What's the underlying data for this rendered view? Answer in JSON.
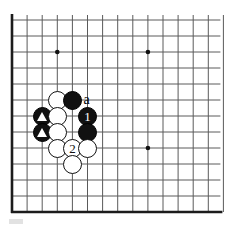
{
  "figure": {
    "kind": "go-board-diagram",
    "board": {
      "line_color": "#5a5a5a",
      "edge_color": "#1c1c1c",
      "background_color": "#ffffff",
      "origin_x": 12,
      "origin_y": 20,
      "cell_w": 15.1,
      "cell_h": 16.0,
      "cols": 14,
      "rows": 12,
      "edges_drawn": [
        "left",
        "bottom"
      ],
      "star_points": [
        {
          "col": 3,
          "row": 2
        },
        {
          "col": 9,
          "row": 2
        },
        {
          "col": 9,
          "row": 8
        }
      ]
    },
    "stones": [
      {
        "id": "w-a1",
        "color": "white",
        "col": 3,
        "row": 5,
        "marker": "none",
        "label": ""
      },
      {
        "id": "b-a1",
        "color": "black",
        "col": 4,
        "row": 5,
        "marker": "none",
        "label": ""
      },
      {
        "id": "b-tri1",
        "color": "black",
        "col": 2,
        "row": 6,
        "marker": "triangle",
        "label": ""
      },
      {
        "id": "w-b1",
        "color": "white",
        "col": 3,
        "row": 6,
        "marker": "none",
        "label": ""
      },
      {
        "id": "b-move1",
        "color": "black",
        "col": 5,
        "row": 6,
        "marker": "none",
        "label": "1"
      },
      {
        "id": "b-tri2",
        "color": "black",
        "col": 2,
        "row": 7,
        "marker": "triangle",
        "label": ""
      },
      {
        "id": "w-b2",
        "color": "white",
        "col": 3,
        "row": 7,
        "marker": "none",
        "label": ""
      },
      {
        "id": "b-c1",
        "color": "black",
        "col": 5,
        "row": 7,
        "marker": "none",
        "label": ""
      },
      {
        "id": "w-c1",
        "color": "white",
        "col": 3,
        "row": 8,
        "marker": "none",
        "label": ""
      },
      {
        "id": "w-move2",
        "color": "white",
        "col": 4,
        "row": 8,
        "marker": "none",
        "label": "2"
      },
      {
        "id": "w-c2",
        "color": "white",
        "col": 5,
        "row": 8,
        "marker": "none",
        "label": ""
      },
      {
        "id": "w-d1",
        "color": "white",
        "col": 4,
        "row": 9,
        "marker": "none",
        "label": ""
      }
    ],
    "point_labels": [
      {
        "id": "label-a",
        "text": "a",
        "col": 5,
        "row": 5
      }
    ],
    "footer_artifact": {
      "present": true,
      "color": "#e2e2e2"
    }
  },
  "chart_data": {
    "type": "table",
    "xlabel": "column (grid index from left edge)",
    "ylabel": "row (grid index from top line)",
    "legend": [
      "black stone",
      "white stone",
      "triangle-marked black stone",
      "numbered move",
      "point label"
    ],
    "grid": true,
    "xlim": [
      0,
      14
    ],
    "ylim": [
      0,
      12
    ],
    "columns": [
      "col",
      "row",
      "color",
      "marker",
      "label"
    ],
    "rows": [
      [
        3,
        5,
        "white",
        "none",
        ""
      ],
      [
        4,
        5,
        "black",
        "none",
        ""
      ],
      [
        5,
        5,
        "none",
        "none",
        "a"
      ],
      [
        2,
        6,
        "black",
        "triangle",
        ""
      ],
      [
        3,
        6,
        "white",
        "none",
        ""
      ],
      [
        5,
        6,
        "black",
        "none",
        "1"
      ],
      [
        2,
        7,
        "black",
        "triangle",
        ""
      ],
      [
        3,
        7,
        "white",
        "none",
        ""
      ],
      [
        5,
        7,
        "black",
        "none",
        ""
      ],
      [
        3,
        8,
        "white",
        "none",
        ""
      ],
      [
        4,
        8,
        "white",
        "none",
        "2"
      ],
      [
        5,
        8,
        "white",
        "none",
        ""
      ],
      [
        4,
        9,
        "white",
        "none",
        ""
      ]
    ],
    "star_points": [
      [
        3,
        2
      ],
      [
        9,
        2
      ],
      [
        9,
        8
      ]
    ],
    "counts": {
      "black_stones": 5,
      "white_stones": 7,
      "triangle_marks": 2,
      "numbered_moves": 2,
      "letter_labels": 1
    }
  }
}
